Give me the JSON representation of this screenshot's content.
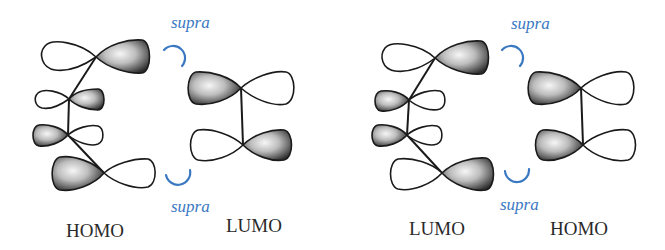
{
  "figure": {
    "colors": {
      "lobe_outline": "#1a1a1a",
      "bond": "#1a1a1a",
      "shaded_lobe_dark": "#2b2b2b",
      "shaded_lobe_light": "#f4f4f4",
      "empty_lobe": "#ffffff",
      "supra_accent": "#3a78c2",
      "label_text": "#2a2a2a"
    }
  },
  "panels": [
    {
      "id": "left",
      "diene_label": "HOMO",
      "dienophile_label": "LUMO",
      "supra_top": "supra",
      "supra_bottom": "supra",
      "diene_phases": [
        "right-shaded",
        "right-shaded",
        "left-shaded",
        "left-shaded"
      ],
      "dienophile_phases": [
        "left-shaded",
        "right-shaded"
      ]
    },
    {
      "id": "right",
      "diene_label": "LUMO",
      "dienophile_label": "HOMO",
      "supra_top": "supra",
      "supra_bottom": "supra",
      "diene_phases": [
        "right-shaded",
        "left-shaded",
        "left-shaded",
        "right-shaded"
      ],
      "dienophile_phases": [
        "left-shaded",
        "left-shaded"
      ]
    }
  ]
}
